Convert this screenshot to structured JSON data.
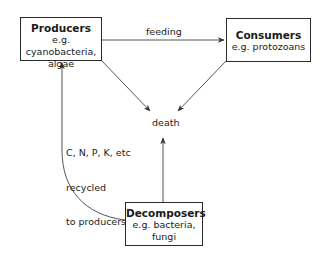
{
  "diagram": {
    "nodes": {
      "producers": {
        "title": "Producers",
        "lines": [
          "e.g. cyanobacteria,",
          "algae"
        ]
      },
      "consumers": {
        "title": "Consumers",
        "lines": [
          "e.g. protozoans"
        ]
      },
      "decomposers": {
        "title": "Decomposers",
        "lines": [
          "e.g. bacteria,",
          "fungi"
        ]
      },
      "death": {
        "label": "death"
      }
    },
    "edges": [
      {
        "from": "producers",
        "to": "consumers",
        "label": "feeding"
      },
      {
        "from": "producers",
        "to": "death",
        "label": ""
      },
      {
        "from": "consumers",
        "to": "death",
        "label": ""
      },
      {
        "from": "decomposers",
        "to": "death",
        "label": ""
      },
      {
        "from": "decomposers",
        "to": "producers",
        "label": "C, N, P, K, etc\nrecycled\nto producers"
      }
    ],
    "recycle_label": [
      "C, N, P, K, etc",
      "recycled",
      "to producers"
    ],
    "feeding_label": "feeding",
    "colors": {
      "line": "#555555",
      "box_border": "#2a2a2a",
      "text": "#1a1a1a",
      "background": "#ffffff"
    }
  }
}
